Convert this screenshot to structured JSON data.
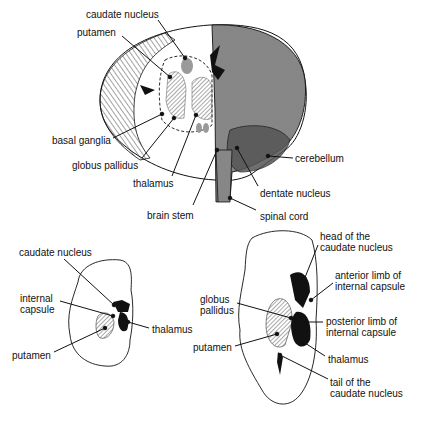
{
  "figure": {
    "top_view": {
      "labels": [
        {
          "id": "caudate-nucleus",
          "text": "caudate nucleus",
          "x": 86,
          "y": 9,
          "lx1": 158,
          "ly1": 20,
          "lx2": 185,
          "ly2": 58
        },
        {
          "id": "putamen",
          "text": "putamen",
          "x": 77,
          "y": 27,
          "lx1": 122,
          "ly1": 36,
          "lx2": 170,
          "ly2": 77
        },
        {
          "id": "basal-ganglia",
          "text": "basal ganglia",
          "x": 52,
          "y": 135,
          "lx1": 113,
          "ly1": 138,
          "lx2": 162,
          "ly2": 114
        },
        {
          "id": "globus-pallidus",
          "text": "globus pallidus",
          "x": 72,
          "y": 160,
          "lx1": 142,
          "ly1": 158,
          "lx2": 174,
          "ly2": 118
        },
        {
          "id": "thalamus",
          "text": "thalamus",
          "x": 133,
          "y": 178,
          "lx1": 172,
          "ly1": 176,
          "lx2": 196,
          "ly2": 115
        },
        {
          "id": "brain-stem",
          "text": "brain stem",
          "x": 147,
          "y": 210,
          "lx1": 193,
          "ly1": 205,
          "lx2": 217,
          "ly2": 150
        },
        {
          "id": "cerebellum",
          "text": "cerebellum",
          "x": 295,
          "y": 153,
          "lx1": 293,
          "ly1": 158,
          "lx2": 268,
          "ly2": 156
        },
        {
          "id": "dentate-nucleus",
          "text": "dentate nucleus",
          "x": 260,
          "y": 188,
          "lx1": 258,
          "ly1": 186,
          "lx2": 237,
          "ly2": 148
        },
        {
          "id": "spinal-cord",
          "text": "spinal cord",
          "x": 260,
          "y": 211,
          "lx1": 256,
          "ly1": 210,
          "lx2": 230,
          "ly2": 198
        }
      ]
    },
    "left_section": {
      "labels": [
        {
          "id": "caudate-nucleus",
          "text": "caudate nucleus",
          "x": 19,
          "y": 247,
          "lx1": 64,
          "ly1": 259,
          "lx2": 114,
          "ly2": 305
        },
        {
          "id": "internal-capsule",
          "text": "internal\ncapsule",
          "x": 20,
          "y": 293,
          "lx1": 60,
          "ly1": 301,
          "lx2": 113,
          "ly2": 316
        },
        {
          "id": "thalamus",
          "text": "thalamus",
          "x": 152,
          "y": 324,
          "lx1": 149,
          "ly1": 328,
          "lx2": 128,
          "ly2": 322
        },
        {
          "id": "putamen",
          "text": "putamen",
          "x": 12,
          "y": 350,
          "lx1": 54,
          "ly1": 352,
          "lx2": 105,
          "ly2": 328
        }
      ]
    },
    "right_section": {
      "labels": [
        {
          "id": "head-of-caudate",
          "text": "head of the\ncaudate nucleus",
          "x": 320,
          "y": 231,
          "lx1": 318,
          "ly1": 245,
          "lx2": 300,
          "ly2": 290
        },
        {
          "id": "anterior-limb",
          "text": "anterior limb of\ninternal capsule",
          "x": 335,
          "y": 270,
          "lx1": 333,
          "ly1": 283,
          "lx2": 311,
          "ly2": 300
        },
        {
          "id": "globus-pallidus",
          "text": "globus\npallidus",
          "x": 200,
          "y": 294,
          "lx1": 237,
          "ly1": 303,
          "lx2": 291,
          "ly2": 318
        },
        {
          "id": "posterior-limb",
          "text": "posterior limb of\ninternal capsule",
          "x": 326,
          "y": 316,
          "lx1": 323,
          "ly1": 322,
          "lx2": 296,
          "ly2": 322
        },
        {
          "id": "putamen",
          "text": "putamen",
          "x": 193,
          "y": 342,
          "lx1": 235,
          "ly1": 346,
          "lx2": 277,
          "ly2": 334
        },
        {
          "id": "thalamus",
          "text": "thalamus",
          "x": 328,
          "y": 354,
          "lx1": 325,
          "ly1": 356,
          "lx2": 305,
          "ly2": 343
        },
        {
          "id": "tail-of-caudate",
          "text": "tail of the\ncaudate nucleus",
          "x": 330,
          "y": 377,
          "lx1": 328,
          "ly1": 379,
          "lx2": 280,
          "ly2": 355
        }
      ]
    },
    "colors": {
      "ink": "#111111",
      "shade": "#9a9a9a",
      "background": "#ffffff"
    }
  }
}
